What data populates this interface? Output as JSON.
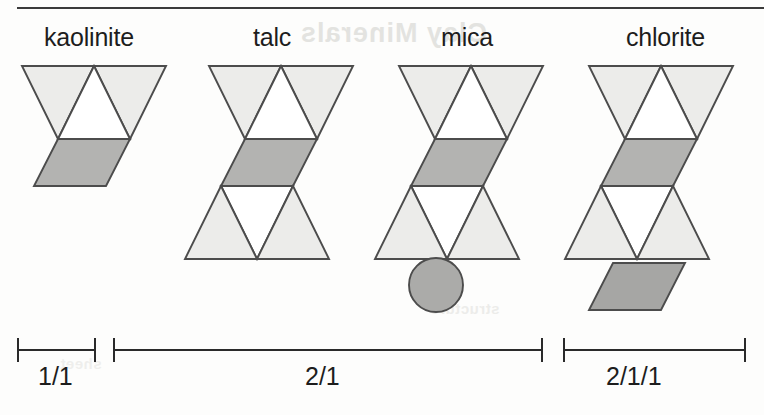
{
  "figure": {
    "background_color": "#fdfdfc",
    "rule_color": "#3b3b3b"
  },
  "colors": {
    "tetrahedral_fill": "#ececea",
    "octahedral_fill": "#b3b3b1",
    "interlayer_fill": "#a6a6a4",
    "cation_fill": "#ababa9",
    "stroke": "#4c4c4c",
    "white_fill": "#ffffff",
    "text": "#1d1d1d"
  },
  "ghost": {
    "line_1": "Clay Minerals",
    "line_2": "structure",
    "line_3": "sheet"
  },
  "minerals": [
    {
      "key": "kaolinite",
      "label": "kaolinite",
      "label_x": 44,
      "label_y": 23,
      "sheets": [
        "tetrahedral",
        "octahedral"
      ],
      "has_cation": false,
      "has_interlayer": false,
      "ratio": "1/1"
    },
    {
      "key": "talc",
      "label": "talc",
      "label_x": 253,
      "label_y": 23,
      "sheets": [
        "tetrahedral",
        "octahedral",
        "tetrahedral"
      ],
      "has_cation": false,
      "has_interlayer": false,
      "ratio": "2/1"
    },
    {
      "key": "mica",
      "label": "mica",
      "label_x": 441,
      "label_y": 23,
      "sheets": [
        "tetrahedral",
        "octahedral",
        "tetrahedral"
      ],
      "has_cation": true,
      "has_interlayer": false,
      "ratio": "2/1"
    },
    {
      "key": "chlorite",
      "label": "chlorite",
      "label_x": 626,
      "label_y": 23,
      "sheets": [
        "tetrahedral",
        "octahedral",
        "tetrahedral"
      ],
      "has_cation": false,
      "has_interlayer": true,
      "ratio": "2/1/1"
    }
  ],
  "scalebars": [
    {
      "key": "bar-1-1",
      "label": "1/1",
      "left": 17,
      "width": 79,
      "top": 338,
      "label_x": 38,
      "label_y": 362
    },
    {
      "key": "bar-2-1",
      "label": "2/1",
      "left": 113,
      "width": 430,
      "top": 338,
      "label_x": 305,
      "label_y": 362
    },
    {
      "key": "bar-2-1-1",
      "label": "2/1/1",
      "left": 563,
      "width": 183,
      "top": 338,
      "label_x": 606,
      "label_y": 362
    }
  ]
}
